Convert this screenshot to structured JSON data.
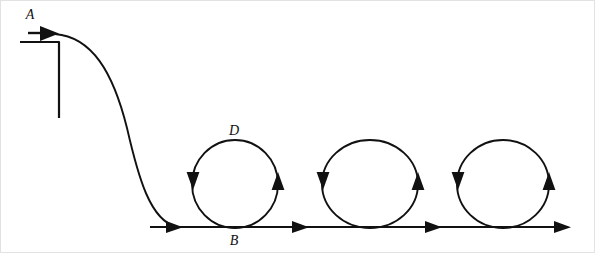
{
  "figure": {
    "title": "",
    "background_color": "#ffffff",
    "stroke_color": "#111111",
    "frame_color": "#e2e2e2",
    "width": 595,
    "height": 253
  },
  "labels": {
    "start_point": "A",
    "loop_top": "D",
    "loop_bottom": "B"
  },
  "icons": {
    "start_arrow": "arrow-right-icon",
    "track_arrow": "arrow-right-icon",
    "loop_left_arrow": "arrow-down-icon",
    "loop_right_arrow": "arrow-up-icon"
  },
  "geometry": {
    "baseline_y": 227,
    "baseline_start_x": 150,
    "baseline_end_x": 570,
    "bracket": {
      "horizontal_y": 42,
      "horizontal_x1": 20,
      "horizontal_x2": 59,
      "vertical_x": 59,
      "vertical_y1": 42,
      "vertical_y2": 118
    },
    "ramp_curve": "M 55,34 C 90,36 112,70 128,130 C 140,178 152,220 178,227",
    "loops": [
      {
        "cx": 235,
        "cy": 184,
        "rx": 43,
        "ry": 44
      },
      {
        "cx": 370,
        "cy": 184,
        "rx": 48,
        "ry": 44
      },
      {
        "cx": 503,
        "cy": 184,
        "rx": 46,
        "ry": 44
      }
    ],
    "baseline_arrow_x": [
      180,
      307,
      440,
      568
    ]
  }
}
